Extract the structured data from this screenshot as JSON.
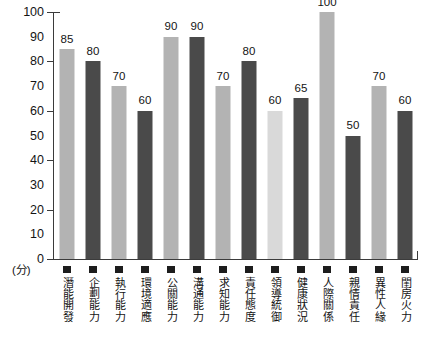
{
  "chart_data": {
    "type": "bar",
    "title": "",
    "subtitle": "",
    "xlabel": "",
    "ylabel": "(分)",
    "ylim": [
      0,
      100
    ],
    "ytick_step": 10,
    "grid": false,
    "legend": "none",
    "yticks": [
      "100",
      "90",
      "80",
      "70",
      "60",
      "50",
      "40",
      "30",
      "20",
      "10",
      "0"
    ],
    "categories": [
      "潛能開發",
      "企劃能力",
      "執行能力",
      "環境適應",
      "公關能力",
      "溝通能力",
      "求知能力",
      "責任態度",
      "領導統御",
      "健康狀況",
      "人際關係",
      "親情責任",
      "異性人緣",
      "閨房火力"
    ],
    "values": [
      85,
      80,
      70,
      60,
      90,
      90,
      70,
      80,
      60,
      65,
      100,
      50,
      70,
      60
    ],
    "bar_colors": [
      "#b3b3b3",
      "#4a4a4a",
      "#b3b3b3",
      "#4a4a4a",
      "#b3b3b3",
      "#4a4a4a",
      "#b3b3b3",
      "#4a4a4a",
      "#d9d9d9",
      "#4a4a4a",
      "#b3b3b3",
      "#4a4a4a",
      "#b3b3b3",
      "#4a4a4a"
    ],
    "colors": {
      "light_bar": "#b3b3b3",
      "dark_bar": "#4a4a4a",
      "pale_bar": "#d9d9d9",
      "axis": "#3b3b3b",
      "text": "#141414",
      "background": "#ffffff",
      "legend_swatch": "#1d1d1d"
    }
  }
}
